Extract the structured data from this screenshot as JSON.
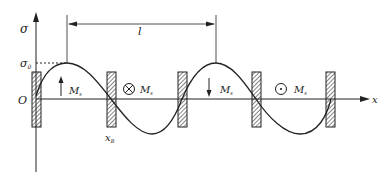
{
  "diagram": {
    "type": "domain-wall stress distribution",
    "axes": {
      "y_label": "σ",
      "x_label": "x",
      "origin_label": "O"
    },
    "labels": {
      "sigma0": "σ",
      "sigma0_sub": "0",
      "period": "l",
      "xB": "x",
      "xB_sub": "B",
      "Ms": "M",
      "Ms_sub": "s"
    },
    "magnetization_regions": [
      {
        "symbol": "up-arrow",
        "label": "M",
        "sub": "s"
      },
      {
        "symbol": "into-page",
        "label": "M",
        "sub": "s"
      },
      {
        "symbol": "down-arrow",
        "label": "M",
        "sub": "s"
      },
      {
        "symbol": "out-of-page",
        "label": "M",
        "sub": "s"
      }
    ],
    "domain_walls": 5,
    "colors": {
      "line": "#222222",
      "background": "#ffffff"
    }
  }
}
